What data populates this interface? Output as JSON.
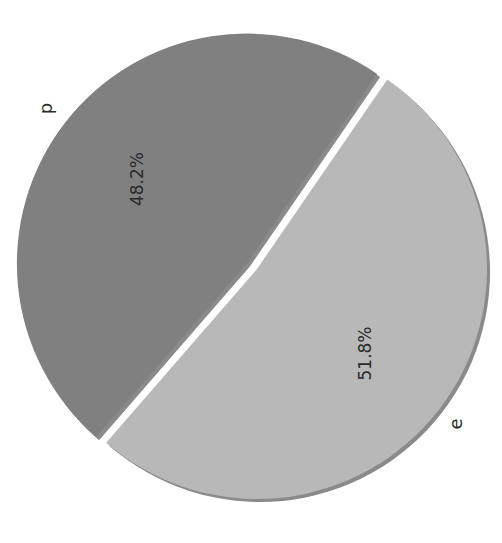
{
  "chart_data": {
    "type": "pie",
    "title": "",
    "orientation": "rotated 90 degrees (text vertical)",
    "categories": [
      "p",
      "e"
    ],
    "values": [
      48.2,
      51.8
    ],
    "labels": [
      "p",
      "e"
    ],
    "autopct_labels": [
      "48.2%",
      "51.8%"
    ],
    "explode": [
      0.04,
      0
    ],
    "shadow": true,
    "colors": [
      "#808080",
      "#b8b8b8"
    ],
    "legend": null
  },
  "layout": {
    "cx": 254,
    "cy": 269,
    "r": 230,
    "start_angle_deg": -55.5,
    "shadow_color": "#8a8a8a",
    "explode_px": 9
  }
}
